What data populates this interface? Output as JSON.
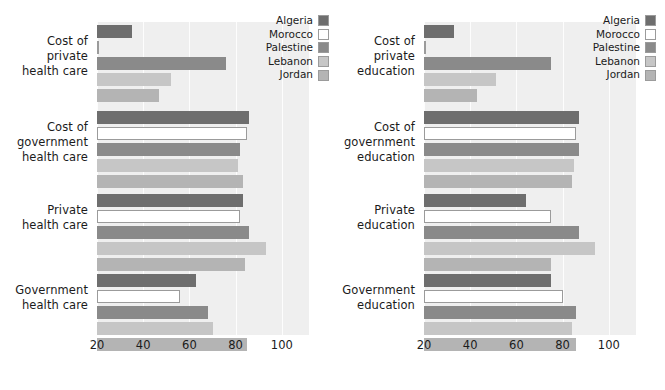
{
  "legend": {
    "position": "top-right",
    "entries": [
      {
        "label": "Algeria",
        "color": "#6e6e6e"
      },
      {
        "label": "Morocco",
        "color": "#ffffff"
      },
      {
        "label": "Palestine",
        "color": "#8a8a8a"
      },
      {
        "label": "Lebanon",
        "color": "#c6c6c6"
      },
      {
        "label": "Jordan",
        "color": "#b4b4b4"
      }
    ]
  },
  "axis": {
    "ticks": [
      "20",
      "40",
      "60",
      "80",
      "100"
    ],
    "min": 20,
    "max": 100
  },
  "chart_data": [
    {
      "type": "bar",
      "orientation": "horizontal",
      "title": "",
      "xlabel": "",
      "ylabel": "",
      "xlim": [
        20,
        112
      ],
      "grid": true,
      "legend_position": "top-right",
      "categories": [
        "Cost of\nprivate\nhealth care",
        "Cost of\ngovernment\nhealth care",
        "Private\nhealth care",
        "Government\nhealth care"
      ],
      "series": [
        {
          "name": "Algeria",
          "color": "#6e6e6e",
          "values": [
            35,
            86,
            83,
            63
          ]
        },
        {
          "name": "Morocco",
          "color": "#ffffff",
          "values": [
            21,
            85,
            82,
            56
          ]
        },
        {
          "name": "Palestine",
          "color": "#8a8a8a",
          "values": [
            76,
            82,
            86,
            68
          ]
        },
        {
          "name": "Lebanon",
          "color": "#c6c6c6",
          "values": [
            52,
            81,
            93,
            70
          ]
        },
        {
          "name": "Jordan",
          "color": "#b4b4b4",
          "values": [
            47,
            83,
            84,
            85
          ]
        }
      ]
    },
    {
      "type": "bar",
      "orientation": "horizontal",
      "title": "",
      "xlabel": "",
      "ylabel": "",
      "xlim": [
        20,
        112
      ],
      "grid": true,
      "legend_position": "top-right",
      "categories": [
        "Cost of\nprivate\neducation",
        "Cost of\ngovernment\neducation",
        "Private\neducation",
        "Government\neducation"
      ],
      "series": [
        {
          "name": "Algeria",
          "color": "#6e6e6e",
          "values": [
            33,
            87,
            64,
            75
          ]
        },
        {
          "name": "Morocco",
          "color": "#ffffff",
          "values": [
            21,
            86,
            75,
            80
          ]
        },
        {
          "name": "Palestine",
          "color": "#8a8a8a",
          "values": [
            75,
            87,
            87,
            86
          ]
        },
        {
          "name": "Lebanon",
          "color": "#c6c6c6",
          "values": [
            51,
            85,
            94,
            84
          ]
        },
        {
          "name": "Jordan",
          "color": "#b4b4b4",
          "values": [
            43,
            84,
            75,
            86
          ]
        }
      ]
    }
  ]
}
